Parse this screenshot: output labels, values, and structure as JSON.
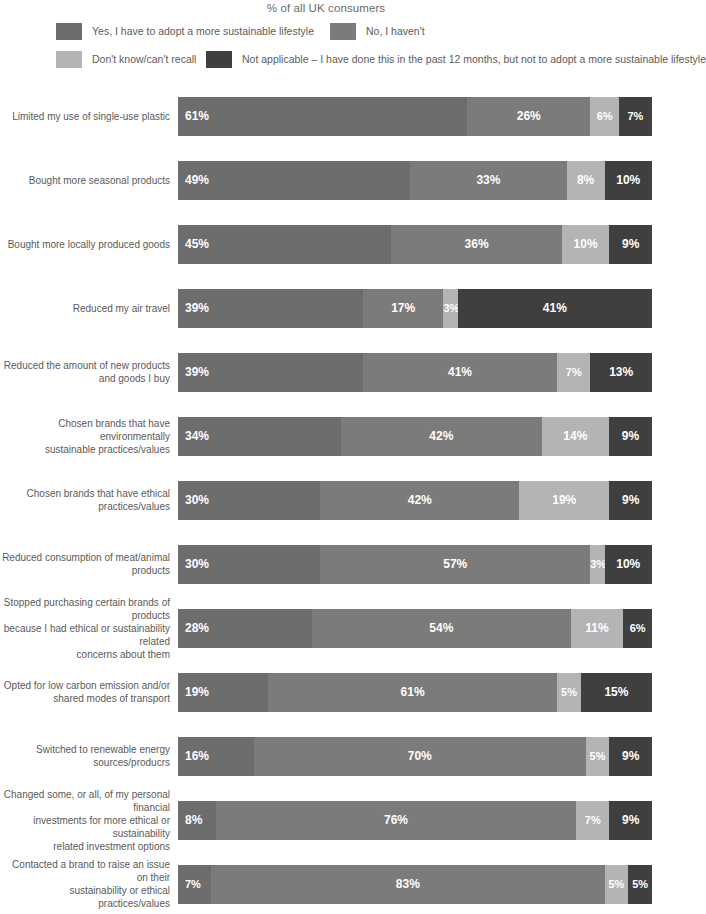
{
  "title": "% of all UK consumers",
  "colors": {
    "yes": "#6d6d6d",
    "no": "#7b7b7b",
    "dontknow": "#b4b4b4",
    "notapplicable": "#3f3f3f",
    "label_text": "#5a5a5a",
    "value_text": "#ffffff",
    "background": "#ffffff"
  },
  "legend": {
    "items": [
      {
        "label": "Yes, I have to adopt a more sustainable lifestyle",
        "color": "#6d6d6d",
        "key": "yes"
      },
      {
        "label": "No, I haven't",
        "color": "#7b7b7b",
        "key": "no"
      },
      {
        "label": "Don't know/can't recall",
        "color": "#b4b4b4",
        "key": "dontknow"
      },
      {
        "label": "Not applicable – I have done this in the past 12 months, but not to adopt a more sustainable lifestyle",
        "color": "#3f3f3f",
        "key": "notapplicable"
      }
    ]
  },
  "chart_data": {
    "type": "bar",
    "subtype": "stacked-horizontal-100",
    "title": "% of all UK consumers",
    "xlabel": "",
    "ylabel": "",
    "xlim": [
      0,
      100
    ],
    "grid": false,
    "legend_position": "top",
    "categories": [
      "Limited my use of single-use plastic",
      "Bought more seasonal products",
      "Bought more locally produced goods",
      "Reduced my air travel",
      "Reduced the amount of new products and goods I buy",
      "Chosen brands that have environmentally sustainable practices/values",
      "Chosen brands that have ethical practices/values",
      "Reduced consumption of meat/animal products",
      "Stopped purchasing certain brands of products because I had ethical or sustainability related concerns about them",
      "Opted for low carbon emission and/or shared modes of transport",
      "Switched to renewable energy sources/producrs",
      "Changed some, or all, of my personal financial investments for more ethical or sustainability related investment options",
      "Contacted a brand to raise an issue on their sustainability or ethical practices/values"
    ],
    "series": [
      {
        "name": "Yes, I have to adopt a more sustainable lifestyle",
        "color": "#6d6d6d",
        "values": [
          61,
          49,
          45,
          39,
          39,
          34,
          30,
          30,
          28,
          19,
          16,
          8,
          7
        ]
      },
      {
        "name": "No, I haven't",
        "color": "#7b7b7b",
        "values": [
          26,
          33,
          36,
          17,
          41,
          42,
          42,
          57,
          54,
          61,
          70,
          76,
          83
        ]
      },
      {
        "name": "Don't know/can't recall",
        "color": "#b4b4b4",
        "values": [
          6,
          8,
          10,
          3,
          7,
          14,
          19,
          3,
          11,
          5,
          5,
          7,
          5
        ]
      },
      {
        "name": "Not applicable – I have done this in the past 12 months, but not to adopt a more sustainable lifestyle",
        "color": "#3f3f3f",
        "values": [
          7,
          10,
          9,
          41,
          13,
          9,
          9,
          10,
          6,
          15,
          9,
          9,
          5
        ]
      }
    ]
  },
  "rows": [
    {
      "label_lines": [
        "Limited my use of single-use plastic"
      ],
      "segments": [
        {
          "value": 61,
          "text": "61%",
          "color": "#6d6d6d"
        },
        {
          "value": 26,
          "text": "26%",
          "color": "#7b7b7b"
        },
        {
          "value": 6,
          "text": "6%",
          "color": "#b4b4b4"
        },
        {
          "value": 7,
          "text": "7%",
          "color": "#3f3f3f"
        }
      ]
    },
    {
      "label_lines": [
        "Bought more seasonal products"
      ],
      "segments": [
        {
          "value": 49,
          "text": "49%",
          "color": "#6d6d6d"
        },
        {
          "value": 33,
          "text": "33%",
          "color": "#7b7b7b"
        },
        {
          "value": 8,
          "text": "8%",
          "color": "#b4b4b4"
        },
        {
          "value": 10,
          "text": "10%",
          "color": "#3f3f3f"
        }
      ]
    },
    {
      "label_lines": [
        "Bought more locally produced goods"
      ],
      "segments": [
        {
          "value": 45,
          "text": "45%",
          "color": "#6d6d6d"
        },
        {
          "value": 36,
          "text": "36%",
          "color": "#7b7b7b"
        },
        {
          "value": 10,
          "text": "10%",
          "color": "#b4b4b4"
        },
        {
          "value": 9,
          "text": "9%",
          "color": "#3f3f3f"
        }
      ]
    },
    {
      "label_lines": [
        "Reduced my air travel"
      ],
      "segments": [
        {
          "value": 39,
          "text": "39%",
          "color": "#6d6d6d"
        },
        {
          "value": 17,
          "text": "17%",
          "color": "#7b7b7b"
        },
        {
          "value": 3,
          "text": "3%",
          "color": "#b4b4b4"
        },
        {
          "value": 41,
          "text": "41%",
          "color": "#3f3f3f"
        }
      ]
    },
    {
      "label_lines": [
        "Reduced the amount of new products",
        "and goods I buy"
      ],
      "segments": [
        {
          "value": 39,
          "text": "39%",
          "color": "#6d6d6d"
        },
        {
          "value": 41,
          "text": "41%",
          "color": "#7b7b7b"
        },
        {
          "value": 7,
          "text": "7%",
          "color": "#b4b4b4"
        },
        {
          "value": 13,
          "text": "13%",
          "color": "#3f3f3f"
        }
      ]
    },
    {
      "label_lines": [
        "Chosen brands that have environmentally",
        "sustainable practices/values"
      ],
      "segments": [
        {
          "value": 34,
          "text": "34%",
          "color": "#6d6d6d"
        },
        {
          "value": 42,
          "text": "42%",
          "color": "#7b7b7b"
        },
        {
          "value": 14,
          "text": "14%",
          "color": "#b4b4b4"
        },
        {
          "value": 9,
          "text": "9%",
          "color": "#3f3f3f"
        }
      ]
    },
    {
      "label_lines": [
        "Chosen brands that have ethical practices/values"
      ],
      "segments": [
        {
          "value": 30,
          "text": "30%",
          "color": "#6d6d6d"
        },
        {
          "value": 42,
          "text": "42%",
          "color": "#7b7b7b"
        },
        {
          "value": 19,
          "text": "19%",
          "color": "#b4b4b4"
        },
        {
          "value": 9,
          "text": "9%",
          "color": "#3f3f3f"
        }
      ]
    },
    {
      "label_lines": [
        "Reduced consumption of meat/animal products"
      ],
      "segments": [
        {
          "value": 30,
          "text": "30%",
          "color": "#6d6d6d"
        },
        {
          "value": 57,
          "text": "57%",
          "color": "#7b7b7b"
        },
        {
          "value": 3,
          "text": "3%",
          "color": "#b4b4b4"
        },
        {
          "value": 10,
          "text": "10%",
          "color": "#3f3f3f"
        }
      ]
    },
    {
      "label_lines": [
        "Stopped purchasing certain brands of products",
        "because I had ethical or sustainability related",
        "concerns about them"
      ],
      "segments": [
        {
          "value": 28,
          "text": "28%",
          "color": "#6d6d6d"
        },
        {
          "value": 54,
          "text": "54%",
          "color": "#7b7b7b"
        },
        {
          "value": 11,
          "text": "11%",
          "color": "#b4b4b4"
        },
        {
          "value": 6,
          "text": "6%",
          "color": "#3f3f3f"
        }
      ]
    },
    {
      "label_lines": [
        "Opted for low carbon emission and/or",
        "shared modes of transport"
      ],
      "segments": [
        {
          "value": 19,
          "text": "19%",
          "color": "#6d6d6d"
        },
        {
          "value": 61,
          "text": "61%",
          "color": "#7b7b7b"
        },
        {
          "value": 5,
          "text": "5%",
          "color": "#b4b4b4"
        },
        {
          "value": 15,
          "text": "15%",
          "color": "#3f3f3f"
        }
      ]
    },
    {
      "label_lines": [
        "Switched to renewable energy sources/producrs"
      ],
      "segments": [
        {
          "value": 16,
          "text": "16%",
          "color": "#6d6d6d"
        },
        {
          "value": 70,
          "text": "70%",
          "color": "#7b7b7b"
        },
        {
          "value": 5,
          "text": "5%",
          "color": "#b4b4b4"
        },
        {
          "value": 9,
          "text": "9%",
          "color": "#3f3f3f"
        }
      ]
    },
    {
      "label_lines": [
        "Changed some, or all, of my personal financial",
        "investments for more ethical or sustainability",
        "related investment options"
      ],
      "segments": [
        {
          "value": 8,
          "text": "8%",
          "color": "#6d6d6d"
        },
        {
          "value": 76,
          "text": "76%",
          "color": "#7b7b7b"
        },
        {
          "value": 7,
          "text": "7%",
          "color": "#b4b4b4"
        },
        {
          "value": 9,
          "text": "9%",
          "color": "#3f3f3f"
        }
      ]
    },
    {
      "label_lines": [
        "Contacted a brand to raise an issue on their",
        "sustainability or ethical practices/values"
      ],
      "segments": [
        {
          "value": 7,
          "text": "7%",
          "color": "#6d6d6d"
        },
        {
          "value": 83,
          "text": "83%",
          "color": "#7b7b7b"
        },
        {
          "value": 5,
          "text": "5%",
          "color": "#b4b4b4"
        },
        {
          "value": 5,
          "text": "5%",
          "color": "#3f3f3f"
        }
      ]
    }
  ]
}
